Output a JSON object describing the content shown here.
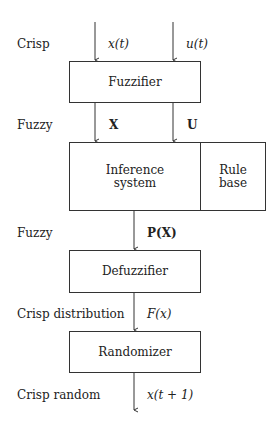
{
  "diagram": {
    "levels": [
      {
        "label": "Crisp",
        "signals": [
          "x(t)",
          "u(t)"
        ]
      },
      {
        "label": "Fuzzy",
        "signals": [
          "X",
          "U"
        ]
      },
      {
        "label": "Fuzzy",
        "signals": [
          "P(X)"
        ]
      },
      {
        "label": "Crisp distribution",
        "signals": [
          "F(x)"
        ]
      },
      {
        "label": "Crisp random",
        "signals": [
          "x(t + 1)"
        ]
      }
    ],
    "blocks": {
      "fuzzifier": "Fuzzifier",
      "inference_line1": "Inference",
      "inference_line2": "system",
      "rule_base_line1": "Rule",
      "rule_base_line2": "base",
      "defuzzifier": "Defuzzifier",
      "randomizer": "Randomizer"
    },
    "colors": {
      "line": "#333333",
      "background": "#ffffff"
    }
  }
}
